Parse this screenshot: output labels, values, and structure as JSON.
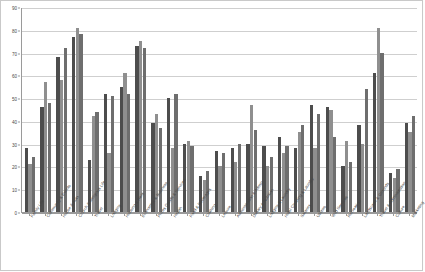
{
  "chart_data": {
    "type": "bar",
    "title": "",
    "subtitle": "",
    "xlabel": "",
    "ylabel": "",
    "ylim": [
      0,
      90
    ],
    "yticks": [
      0,
      10,
      20,
      30,
      40,
      50,
      60,
      70,
      80,
      90
    ],
    "grid": true,
    "legend_position": "top-center",
    "orientation": "vertical",
    "grouping": "grouped",
    "xtick_rotation": -55,
    "categories": [
      "Family Life",
      "Community & Events",
      "House & Auto",
      "Church & Religious Life",
      "Travel",
      "Lodging",
      "Housing & Rent",
      "Economics & Business",
      "Prices Goods & Services",
      "Health",
      "Food & Beverages",
      "Clothing",
      "Leisure",
      "Administration & Admin",
      "Dietary & Nutrition",
      "Lodging & Laundry",
      "Hotel Cleaning & Laundry",
      "Salaries",
      "Utilities",
      "Wild Services",
      "Recreation",
      "Landscape & Grounds",
      "Travel & Administration",
      "Culture",
      "Marketing"
    ],
    "series": [
      {
        "name": "West Michigan",
        "color": "#4d4d4d",
        "values": [
          28,
          46,
          68,
          77,
          23,
          52,
          55,
          73,
          39,
          50,
          30,
          16,
          27,
          28,
          30,
          29,
          33,
          28,
          47,
          46,
          20,
          38,
          61,
          17,
          39
        ]
      },
      {
        "name": "Iowa/South Dakota",
        "color": "#8f8f8f",
        "values": [
          21,
          57,
          58,
          81,
          42,
          26,
          61,
          75,
          43,
          28,
          31,
          14,
          20,
          22,
          47,
          20,
          26,
          35,
          28,
          45,
          31,
          30,
          81,
          15,
          35
        ]
      },
      {
        "name": "Wisconsin/Illinois/Minnesota",
        "color": "#6e6e6e",
        "values": [
          24,
          48,
          72,
          78,
          44,
          51,
          52,
          72,
          37,
          52,
          29,
          18,
          26,
          30,
          36,
          24,
          29,
          38,
          43,
          33,
          22,
          54,
          70,
          19,
          42
        ]
      }
    ],
    "legend": [
      "West Michigan",
      "Iowa/South Dakota",
      "Wisconsin/Illinois/Minnesota"
    ]
  }
}
